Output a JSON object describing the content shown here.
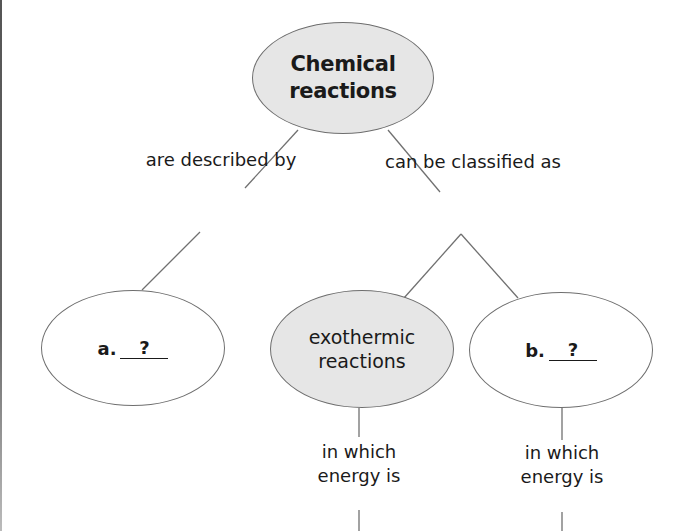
{
  "diagram": {
    "type": "concept-map",
    "root": {
      "label_line1": "Chemical",
      "label_line2": "reactions"
    },
    "link_labels": {
      "described_by": "are described by",
      "classified_as": "can be classified as",
      "exo_energy_line1": "in which",
      "exo_energy_line2": "energy is",
      "b_energy_line1": "in which",
      "b_energy_line2": "energy is"
    },
    "nodes": {
      "a": {
        "prefix": "a.",
        "blank": "?"
      },
      "exothermic": {
        "label_line1": "exothermic",
        "label_line2": "reactions"
      },
      "b": {
        "prefix": "b.",
        "blank": "?"
      },
      "c": {
        "prefix": "c.",
        "blank": "?"
      },
      "absorbed": {
        "label": "absorbed"
      }
    },
    "colors": {
      "shaded_fill": "#e6e6e6",
      "plain_fill": "#ffffff",
      "stroke": "#6e6e6e"
    }
  }
}
